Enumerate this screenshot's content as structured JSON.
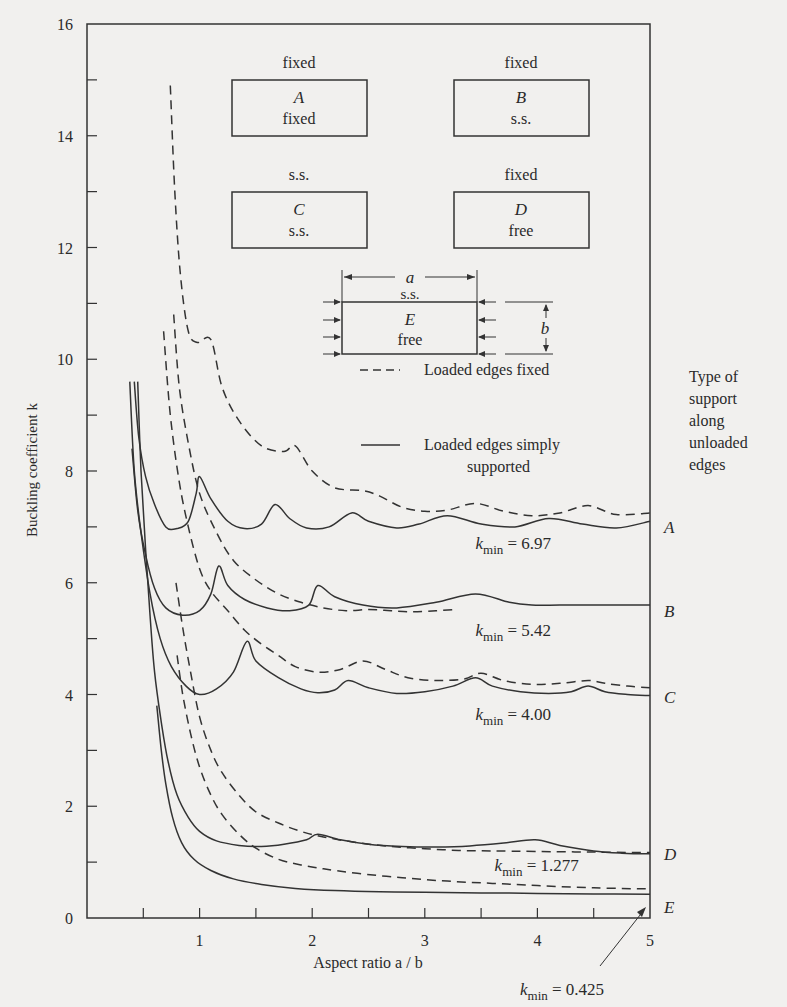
{
  "chart_data": {
    "type": "line",
    "title": "",
    "xlabel": "Aspect ratio a / b",
    "ylabel": "Buckling coefficient k",
    "xlim": [
      0,
      5
    ],
    "ylim": [
      0,
      16
    ],
    "x_ticks": [
      0.5,
      1,
      1.5,
      2,
      2.5,
      3,
      3.5,
      4,
      4.5,
      5
    ],
    "x_tick_labels": [
      "1",
      "2",
      "3",
      "4",
      "5"
    ],
    "y_ticks": [
      1,
      2,
      3,
      4,
      5,
      6,
      7,
      8,
      9,
      10,
      11,
      12,
      13,
      14,
      15
    ],
    "y_tick_labels": [
      "0",
      "2",
      "4",
      "6",
      "8",
      "10",
      "12",
      "14",
      "16"
    ],
    "grid": false,
    "legend": [
      {
        "style": "dashed",
        "label": "Loaded edges fixed"
      },
      {
        "style": "solid",
        "label": "Loaded edges simply supported"
      }
    ],
    "side_label": [
      "Type of",
      "support",
      "along",
      "unloaded",
      "edges"
    ],
    "series": [
      {
        "name": "A",
        "style": "dashed",
        "points": [
          [
            0.74,
            14.9
          ],
          [
            0.78,
            13.0
          ],
          [
            0.83,
            11.5
          ],
          [
            0.9,
            10.5
          ],
          [
            0.98,
            10.3
          ],
          [
            1.1,
            10.35
          ],
          [
            1.2,
            9.5
          ],
          [
            1.35,
            8.9
          ],
          [
            1.55,
            8.45
          ],
          [
            1.75,
            8.35
          ],
          [
            1.85,
            8.45
          ],
          [
            2.0,
            8.0
          ],
          [
            2.2,
            7.7
          ],
          [
            2.45,
            7.65
          ],
          [
            2.6,
            7.55
          ],
          [
            2.8,
            7.35
          ],
          [
            3.0,
            7.28
          ],
          [
            3.2,
            7.3
          ],
          [
            3.45,
            7.42
          ],
          [
            3.7,
            7.28
          ],
          [
            3.95,
            7.2
          ],
          [
            4.2,
            7.25
          ],
          [
            4.45,
            7.38
          ],
          [
            4.7,
            7.22
          ],
          [
            5.0,
            7.25
          ]
        ]
      },
      {
        "name": "A",
        "style": "solid",
        "points": [
          [
            0.42,
            9.6
          ],
          [
            0.46,
            8.6
          ],
          [
            0.52,
            7.9
          ],
          [
            0.6,
            7.4
          ],
          [
            0.7,
            7.0
          ],
          [
            0.8,
            6.97
          ],
          [
            0.9,
            7.1
          ],
          [
            0.97,
            7.6
          ],
          [
            1.0,
            7.9
          ],
          [
            1.1,
            7.5
          ],
          [
            1.25,
            7.1
          ],
          [
            1.4,
            6.97
          ],
          [
            1.55,
            7.05
          ],
          [
            1.67,
            7.4
          ],
          [
            1.8,
            7.15
          ],
          [
            1.95,
            6.98
          ],
          [
            2.15,
            7.0
          ],
          [
            2.35,
            7.25
          ],
          [
            2.5,
            7.1
          ],
          [
            2.75,
            6.98
          ],
          [
            2.95,
            7.05
          ],
          [
            3.2,
            7.2
          ],
          [
            3.5,
            7.05
          ],
          [
            3.8,
            7.0
          ],
          [
            4.1,
            7.15
          ],
          [
            4.4,
            7.05
          ],
          [
            4.7,
            6.98
          ],
          [
            5.0,
            7.1
          ]
        ]
      },
      {
        "name": "B",
        "style": "dashed",
        "points": [
          [
            0.77,
            10.8
          ],
          [
            0.82,
            9.5
          ],
          [
            0.9,
            8.5
          ],
          [
            1.0,
            7.6
          ],
          [
            1.15,
            6.9
          ],
          [
            1.3,
            6.4
          ],
          [
            1.5,
            6.05
          ],
          [
            1.7,
            5.8
          ],
          [
            1.9,
            5.65
          ],
          [
            2.1,
            5.55
          ],
          [
            2.3,
            5.5
          ],
          [
            2.5,
            5.52
          ],
          [
            2.7,
            5.5
          ],
          [
            2.9,
            5.48
          ],
          [
            3.1,
            5.5
          ],
          [
            3.25,
            5.52
          ]
        ]
      },
      {
        "name": "B",
        "style": "solid",
        "points": [
          [
            0.4,
            8.4
          ],
          [
            0.45,
            7.3
          ],
          [
            0.52,
            6.5
          ],
          [
            0.6,
            5.9
          ],
          [
            0.7,
            5.55
          ],
          [
            0.85,
            5.42
          ],
          [
            1.0,
            5.5
          ],
          [
            1.1,
            5.8
          ],
          [
            1.17,
            6.3
          ],
          [
            1.25,
            5.95
          ],
          [
            1.4,
            5.7
          ],
          [
            1.6,
            5.55
          ],
          [
            1.8,
            5.5
          ],
          [
            1.97,
            5.6
          ],
          [
            2.05,
            5.95
          ],
          [
            2.2,
            5.75
          ],
          [
            2.45,
            5.6
          ],
          [
            2.75,
            5.55
          ],
          [
            3.1,
            5.65
          ],
          [
            3.45,
            5.8
          ],
          [
            3.75,
            5.65
          ],
          [
            3.95,
            5.6
          ],
          [
            4.2,
            5.6
          ],
          [
            4.5,
            5.6
          ],
          [
            5.0,
            5.6
          ]
        ]
      },
      {
        "name": "C",
        "style": "dashed",
        "points": [
          [
            0.68,
            10.5
          ],
          [
            0.74,
            9.0
          ],
          [
            0.82,
            7.8
          ],
          [
            0.9,
            7.0
          ],
          [
            1.0,
            6.25
          ],
          [
            1.1,
            5.85
          ],
          [
            1.25,
            5.5
          ],
          [
            1.4,
            5.15
          ],
          [
            1.55,
            4.9
          ],
          [
            1.7,
            4.7
          ],
          [
            1.85,
            4.5
          ],
          [
            2.05,
            4.4
          ],
          [
            2.25,
            4.45
          ],
          [
            2.45,
            4.6
          ],
          [
            2.65,
            4.45
          ],
          [
            2.85,
            4.3
          ],
          [
            3.1,
            4.25
          ],
          [
            3.35,
            4.28
          ],
          [
            3.5,
            4.38
          ],
          [
            3.7,
            4.25
          ],
          [
            3.95,
            4.18
          ],
          [
            4.2,
            4.2
          ],
          [
            4.45,
            4.25
          ],
          [
            4.6,
            4.2
          ],
          [
            4.8,
            4.15
          ],
          [
            5.0,
            4.12
          ]
        ]
      },
      {
        "name": "C",
        "style": "solid",
        "points": [
          [
            0.38,
            9.6
          ],
          [
            0.42,
            8.0
          ],
          [
            0.48,
            6.9
          ],
          [
            0.56,
            5.8
          ],
          [
            0.65,
            5.0
          ],
          [
            0.75,
            4.5
          ],
          [
            0.88,
            4.15
          ],
          [
            1.0,
            4.0
          ],
          [
            1.15,
            4.1
          ],
          [
            1.3,
            4.4
          ],
          [
            1.42,
            4.95
          ],
          [
            1.5,
            4.6
          ],
          [
            1.7,
            4.3
          ],
          [
            1.9,
            4.1
          ],
          [
            2.05,
            4.03
          ],
          [
            2.2,
            4.08
          ],
          [
            2.32,
            4.25
          ],
          [
            2.5,
            4.12
          ],
          [
            2.75,
            4.02
          ],
          [
            3.0,
            4.05
          ],
          [
            3.25,
            4.15
          ],
          [
            3.45,
            4.3
          ],
          [
            3.6,
            4.15
          ],
          [
            3.85,
            4.05
          ],
          [
            4.1,
            4.02
          ],
          [
            4.3,
            4.05
          ],
          [
            4.45,
            4.15
          ],
          [
            4.6,
            4.05
          ],
          [
            4.8,
            4.0
          ],
          [
            5.0,
            3.98
          ]
        ]
      },
      {
        "name": "D",
        "style": "dashed",
        "points": [
          [
            0.79,
            6.0
          ],
          [
            0.85,
            5.2
          ],
          [
            0.92,
            4.4
          ],
          [
            1.0,
            3.6
          ],
          [
            1.1,
            3.0
          ],
          [
            1.2,
            2.6
          ],
          [
            1.35,
            2.2
          ],
          [
            1.5,
            1.9
          ],
          [
            1.7,
            1.7
          ],
          [
            1.9,
            1.55
          ],
          [
            2.1,
            1.45
          ],
          [
            2.4,
            1.35
          ],
          [
            2.7,
            1.28
          ],
          [
            3.0,
            1.24
          ],
          [
            3.3,
            1.21
          ],
          [
            3.6,
            1.2
          ],
          [
            4.0,
            1.19
          ],
          [
            4.5,
            1.18
          ],
          [
            5.0,
            1.17
          ]
        ]
      },
      {
        "name": "D",
        "style": "solid",
        "points": [
          [
            0.45,
            9.6
          ],
          [
            0.48,
            8.0
          ],
          [
            0.52,
            6.6
          ],
          [
            0.56,
            5.4
          ],
          [
            0.6,
            4.4
          ],
          [
            0.66,
            3.5
          ],
          [
            0.72,
            2.8
          ],
          [
            0.8,
            2.2
          ],
          [
            0.9,
            1.8
          ],
          [
            1.0,
            1.55
          ],
          [
            1.15,
            1.38
          ],
          [
            1.35,
            1.3
          ],
          [
            1.55,
            1.28
          ],
          [
            1.75,
            1.32
          ],
          [
            1.95,
            1.4
          ],
          [
            2.05,
            1.5
          ],
          [
            2.25,
            1.4
          ],
          [
            2.5,
            1.32
          ],
          [
            2.8,
            1.28
          ],
          [
            3.1,
            1.27
          ],
          [
            3.4,
            1.29
          ],
          [
            3.7,
            1.34
          ],
          [
            3.98,
            1.4
          ],
          [
            4.2,
            1.3
          ],
          [
            4.5,
            1.2
          ],
          [
            4.75,
            1.16
          ],
          [
            5.0,
            1.15
          ]
        ]
      },
      {
        "name": "E",
        "style": "dashed",
        "points": [
          [
            0.8,
            4.7
          ],
          [
            0.85,
            4.0
          ],
          [
            0.92,
            3.3
          ],
          [
            1.0,
            2.7
          ],
          [
            1.1,
            2.2
          ],
          [
            1.2,
            1.85
          ],
          [
            1.35,
            1.5
          ],
          [
            1.5,
            1.25
          ],
          [
            1.7,
            1.05
          ],
          [
            1.9,
            0.95
          ],
          [
            2.1,
            0.88
          ],
          [
            2.4,
            0.8
          ],
          [
            2.8,
            0.72
          ],
          [
            3.2,
            0.66
          ],
          [
            3.6,
            0.62
          ],
          [
            4.0,
            0.58
          ],
          [
            4.5,
            0.54
          ],
          [
            5.0,
            0.52
          ]
        ]
      },
      {
        "name": "E",
        "style": "solid",
        "points": [
          [
            0.62,
            3.8
          ],
          [
            0.66,
            3.0
          ],
          [
            0.7,
            2.4
          ],
          [
            0.76,
            1.8
          ],
          [
            0.84,
            1.35
          ],
          [
            0.95,
            1.05
          ],
          [
            1.1,
            0.85
          ],
          [
            1.3,
            0.7
          ],
          [
            1.55,
            0.6
          ],
          [
            1.85,
            0.53
          ],
          [
            2.2,
            0.49
          ],
          [
            2.6,
            0.47
          ],
          [
            3.0,
            0.46
          ],
          [
            3.5,
            0.45
          ],
          [
            4.0,
            0.44
          ],
          [
            4.5,
            0.43
          ],
          [
            5.0,
            0.425
          ]
        ]
      }
    ],
    "annotations": [
      {
        "text_k": "k",
        "text_sub": "min",
        "text_val": " = 6.97",
        "x": 3.45,
        "y": 6.6,
        "curve": "A"
      },
      {
        "text_k": "k",
        "text_sub": "min",
        "text_val": " = 5.42",
        "x": 3.45,
        "y": 5.05,
        "curve": "B"
      },
      {
        "text_k": "k",
        "text_sub": "min",
        "text_val": " = 4.00",
        "x": 3.45,
        "y": 3.55,
        "curve": "C"
      },
      {
        "text_k": "k",
        "text_sub": "min",
        "text_val": " = 1.277",
        "x": 3.62,
        "y": 0.85,
        "curve": "D"
      },
      {
        "text_k": "k",
        "text_sub": "min",
        "text_val": " = 0.425",
        "curve": "E",
        "arrow": true
      }
    ],
    "curve_labels": [
      "A",
      "B",
      "C",
      "D",
      "E"
    ]
  },
  "diagram": {
    "boxes": [
      {
        "letter": "A",
        "top": "fixed",
        "bottom": "fixed"
      },
      {
        "letter": "B",
        "top": "fixed",
        "bottom": "s.s."
      },
      {
        "letter": "C",
        "top": "s.s.",
        "bottom": "s.s."
      },
      {
        "letter": "D",
        "top": "fixed",
        "bottom": "free"
      }
    ],
    "plate_E": {
      "letter": "E",
      "top": "s.s.",
      "bottom": "free",
      "dim_a": "a",
      "dim_b": "b"
    }
  }
}
